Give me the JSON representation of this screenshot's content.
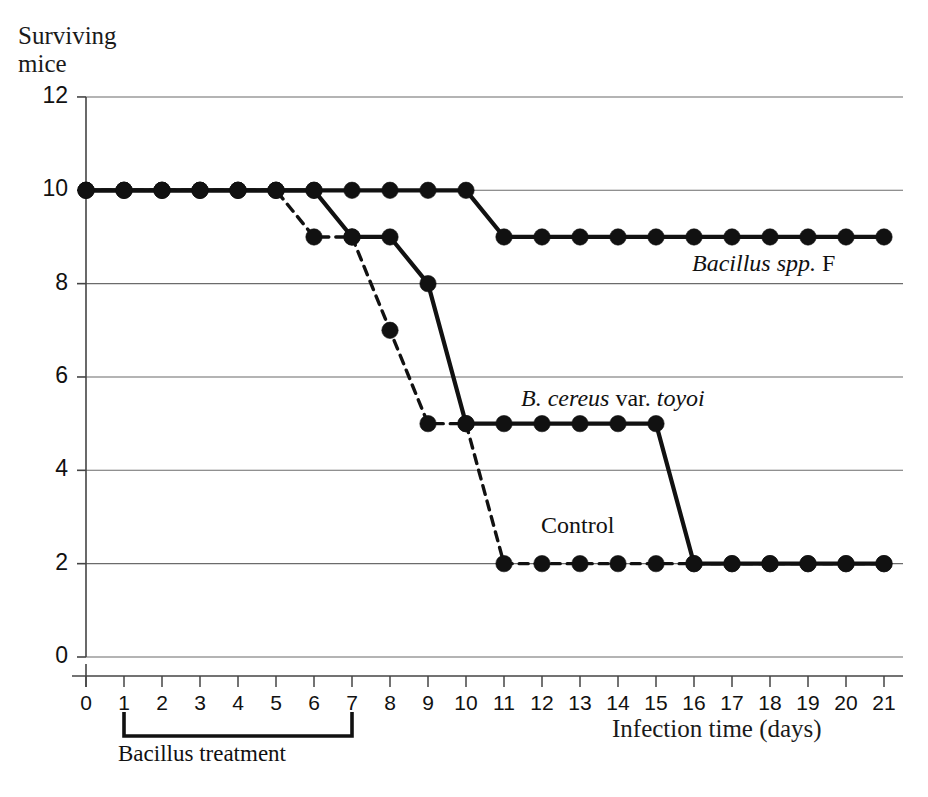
{
  "axes": {
    "y_title": "Surviving\nmice",
    "x_title": "Infection time (days)",
    "y_ticks": [
      "0",
      "2",
      "4",
      "6",
      "8",
      "10",
      "12"
    ],
    "x_ticks": [
      "0",
      "1",
      "2",
      "3",
      "4",
      "5",
      "6",
      "7",
      "8",
      "9",
      "10",
      "11",
      "12",
      "13",
      "14",
      "15",
      "16",
      "17",
      "18",
      "19",
      "20",
      "21"
    ]
  },
  "annotations": {
    "bacillus_f_italic": "Bacillus spp.",
    "bacillus_f_roman": " F",
    "toyoi_italic_1": "B. cereus",
    "toyoi_roman": " var. ",
    "toyoi_italic_2": "toyoi",
    "control": "Control",
    "bracket_label": "Bacillus treatment",
    "caption_fragment": ""
  },
  "colors": {
    "line": "#111111",
    "grid": "#6b6b6b",
    "axis": "#444444",
    "background": "#ffffff"
  },
  "chart_data": {
    "type": "line",
    "title": "",
    "xlabel": "Infection time (days)",
    "ylabel": "Surviving mice",
    "xlim": [
      0,
      21
    ],
    "ylim": [
      0,
      12
    ],
    "yticks": [
      0,
      2,
      4,
      6,
      8,
      10,
      12
    ],
    "xticks": [
      0,
      1,
      2,
      3,
      4,
      5,
      6,
      7,
      8,
      9,
      10,
      11,
      12,
      13,
      14,
      15,
      16,
      17,
      18,
      19,
      20,
      21
    ],
    "grid": "horizontal",
    "legend": "inline-annotations",
    "x": [
      0,
      1,
      2,
      3,
      4,
      5,
      6,
      7,
      8,
      9,
      10,
      11,
      12,
      13,
      14,
      15,
      16,
      17,
      18,
      19,
      20,
      21
    ],
    "series": [
      {
        "name": "Bacillus spp. F",
        "style": "solid",
        "marker": "filled-circle",
        "values": [
          10,
          10,
          10,
          10,
          10,
          10,
          10,
          10,
          10,
          10,
          10,
          9,
          9,
          9,
          9,
          9,
          9,
          9,
          9,
          9,
          9,
          9
        ]
      },
      {
        "name": "B. cereus var. toyoi",
        "style": "solid",
        "marker": "filled-circle",
        "values": [
          10,
          10,
          10,
          10,
          10,
          10,
          10,
          9,
          9,
          8,
          5,
          5,
          5,
          5,
          5,
          5,
          2,
          2,
          2,
          2,
          2,
          2
        ]
      },
      {
        "name": "Control",
        "style": "dashed",
        "marker": "filled-circle",
        "values": [
          10,
          10,
          10,
          10,
          10,
          10,
          9,
          9,
          7,
          5,
          5,
          2,
          2,
          2,
          2,
          2,
          2,
          2,
          2,
          2,
          2,
          2
        ]
      }
    ],
    "annotations": [
      {
        "text": "Bacillus treatment",
        "type": "bracket",
        "x_from": 1,
        "x_to": 7
      }
    ]
  }
}
